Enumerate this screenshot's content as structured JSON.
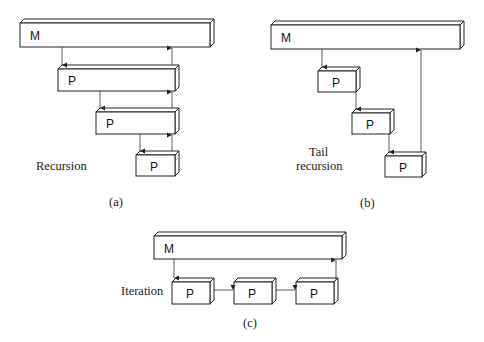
{
  "panels": {
    "a": {
      "caption": "(a)",
      "label": "Recursion",
      "main_box": "M",
      "proc_boxes": [
        "P",
        "P",
        "P"
      ]
    },
    "b": {
      "caption": "(b)",
      "label_line1": "Tail",
      "label_line2": "recursion",
      "main_box": "M",
      "proc_boxes": [
        "P",
        "P",
        "P"
      ]
    },
    "c": {
      "caption": "(c)",
      "label": "Iteration",
      "main_box": "M",
      "proc_boxes": [
        "P",
        "P",
        "P"
      ]
    }
  }
}
